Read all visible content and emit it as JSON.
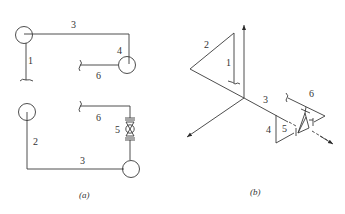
{
  "figure_a": {
    "caption": "(a)",
    "labels": {
      "pipe_1": "1",
      "pipe_2": "2",
      "pipe_3_top": "3",
      "pipe_3_bottom": "3",
      "pipe_4": "4",
      "pipe_5": "5",
      "pipe_6_top": "6",
      "pipe_6_bottom": "6"
    }
  },
  "figure_b": {
    "caption": "(b)",
    "labels": {
      "pipe_1": "1",
      "pipe_2": "2",
      "pipe_3": "3",
      "pipe_4": "4",
      "pipe_5": "5",
      "pipe_6": "6"
    }
  },
  "colors": {
    "line": "#3a3a3a",
    "background": "#ffffff"
  }
}
